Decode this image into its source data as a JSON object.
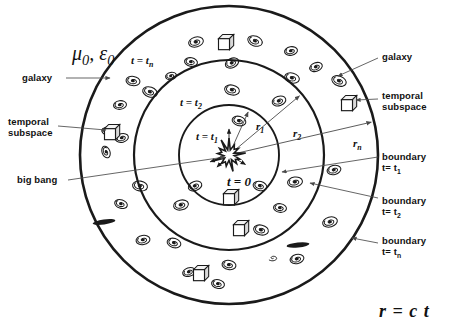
{
  "diagram": {
    "constants_label": "μ0, ε0",
    "equation": "r = c t",
    "center_label": "t = 0",
    "ring_labels": [
      {
        "id": "ring-tn",
        "text": "t = tn",
        "x": 131,
        "y": 54
      },
      {
        "id": "ring-t2",
        "text": "t = t2",
        "x": 180,
        "y": 96
      },
      {
        "id": "ring-t1",
        "text": "t = t1",
        "x": 196,
        "y": 130
      }
    ],
    "radius_labels": [
      {
        "id": "radius-r1",
        "text": "r1",
        "x": 256,
        "y": 120
      },
      {
        "id": "radius-r2",
        "text": "r2",
        "x": 293,
        "y": 127
      },
      {
        "id": "radius-rn",
        "text": "rn",
        "x": 353,
        "y": 137
      }
    ],
    "callouts": [
      {
        "id": "callout-galaxy-left",
        "lines": [
          "galaxy"
        ],
        "x": 22,
        "y": 73
      },
      {
        "id": "callout-temporal-subspace-left",
        "lines": [
          "temporal",
          "subspace"
        ],
        "x": 8,
        "y": 117
      },
      {
        "id": "callout-big-bang",
        "lines": [
          "big bang"
        ],
        "x": 17,
        "y": 175
      },
      {
        "id": "callout-galaxy-right",
        "lines": [
          "galaxy"
        ],
        "x": 382,
        "y": 52
      },
      {
        "id": "callout-temporal-subspace-right",
        "lines": [
          "temporal",
          "subspace"
        ],
        "x": 382,
        "y": 91
      },
      {
        "id": "callout-boundary-t1",
        "lines": [
          "boundary",
          "t= t1"
        ],
        "x": 382,
        "y": 152
      },
      {
        "id": "callout-boundary-t2",
        "lines": [
          "boundary",
          "t= t2"
        ],
        "x": 382,
        "y": 196
      },
      {
        "id": "callout-boundary-tn",
        "lines": [
          "boundary",
          "t= tn"
        ],
        "x": 382,
        "y": 236
      }
    ],
    "geometry": {
      "center_x": 229,
      "center_y": 155,
      "r1": 50,
      "r2": 95,
      "rn": 149
    },
    "colors": {
      "stroke": "#1a1a1a",
      "leader": "#4a4a4a",
      "background": "#ffffff"
    },
    "galaxies": [
      {
        "x": 196,
        "y": 42,
        "r": 7.5,
        "a": -15
      },
      {
        "x": 255,
        "y": 41,
        "r": 7.5,
        "a": 20
      },
      {
        "x": 291,
        "y": 51,
        "r": 6.5,
        "a": -10
      },
      {
        "x": 191,
        "y": 62,
        "r": 6.5,
        "a": 10
      },
      {
        "x": 232,
        "y": 63,
        "r": 7.0,
        "a": -25
      },
      {
        "x": 292,
        "y": 78,
        "r": 7.5,
        "a": 15
      },
      {
        "x": 316,
        "y": 67,
        "r": 6.5,
        "a": -20
      },
      {
        "x": 133,
        "y": 81,
        "r": 7.0,
        "a": 8
      },
      {
        "x": 171,
        "y": 76,
        "r": 5.5,
        "a": -12
      },
      {
        "x": 150,
        "y": 92,
        "r": 7.5,
        "a": 18
      },
      {
        "x": 120,
        "y": 105,
        "r": 6.5,
        "a": -8
      },
      {
        "x": 232,
        "y": 90,
        "r": 7.5,
        "a": 12
      },
      {
        "x": 279,
        "y": 101,
        "r": 7.0,
        "a": -18
      },
      {
        "x": 339,
        "y": 81,
        "r": 7.5,
        "a": 22
      },
      {
        "x": 108,
        "y": 131,
        "r": 6.0,
        "a": 0
      },
      {
        "x": 122,
        "y": 138,
        "r": 6.5,
        "a": -15
      },
      {
        "x": 239,
        "y": 121,
        "r": 7.0,
        "a": 16
      },
      {
        "x": 106,
        "y": 152,
        "r": 6.0,
        "a": 70
      },
      {
        "x": 334,
        "y": 170,
        "r": 7.0,
        "a": -14
      },
      {
        "x": 140,
        "y": 186,
        "r": 7.5,
        "a": 10
      },
      {
        "x": 195,
        "y": 186,
        "r": 7.0,
        "a": -20
      },
      {
        "x": 260,
        "y": 186,
        "r": 7.0,
        "a": 14
      },
      {
        "x": 295,
        "y": 182,
        "r": 7.5,
        "a": -8
      },
      {
        "x": 121,
        "y": 204,
        "r": 6.5,
        "a": 18
      },
      {
        "x": 181,
        "y": 205,
        "r": 7.5,
        "a": -12
      },
      {
        "x": 280,
        "y": 208,
        "r": 6.5,
        "a": 8
      },
      {
        "x": 330,
        "y": 222,
        "r": 7.5,
        "a": -16
      },
      {
        "x": 261,
        "y": 230,
        "r": 7.5,
        "a": 12
      },
      {
        "x": 143,
        "y": 240,
        "r": 7.0,
        "a": -10
      },
      {
        "x": 174,
        "y": 243,
        "r": 7.0,
        "a": 16
      },
      {
        "x": 297,
        "y": 259,
        "r": 7.0,
        "a": -14
      },
      {
        "x": 229,
        "y": 265,
        "r": 7.0,
        "a": 10
      },
      {
        "x": 189,
        "y": 272,
        "r": 6.5,
        "a": -18
      },
      {
        "x": 218,
        "y": 284,
        "r": 6.5,
        "a": 12
      }
    ],
    "cubes": [
      {
        "x": 224,
        "y": 40,
        "s": 11
      },
      {
        "x": 347,
        "y": 101,
        "s": 11
      },
      {
        "x": 110,
        "y": 130,
        "s": 11
      },
      {
        "x": 229,
        "y": 195,
        "s": 11
      },
      {
        "x": 239,
        "y": 226,
        "s": 11
      },
      {
        "x": 199,
        "y": 271,
        "s": 11
      }
    ],
    "edge_galaxies": [
      {
        "x": 104,
        "y": 222,
        "w": 23,
        "h": 5,
        "a": -8
      },
      {
        "x": 298,
        "y": 245,
        "w": 23,
        "h": 5,
        "a": -6
      }
    ],
    "small_spirals": [
      {
        "x": 273,
        "y": 258,
        "r": 5
      }
    ]
  }
}
